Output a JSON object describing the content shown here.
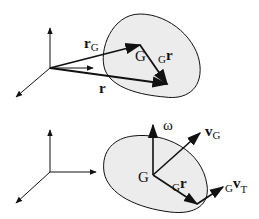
{
  "diagram": {
    "type": "rigid-body kinematics",
    "top_panel": {
      "description": "position vectors of a rigid body",
      "labels": {
        "rG_main": "r",
        "rG_sub": "G",
        "G": "G",
        "Gr_pre": "G",
        "Gr_main": "r",
        "r": "r"
      }
    },
    "bottom_panel": {
      "description": "angular and linear velocity of a rigid body",
      "labels": {
        "omega": "ω",
        "vG_main": "v",
        "vG_sub": "G",
        "G": "G",
        "Gr_pre": "G",
        "Gr_main": "r",
        "GvT_pre": "G",
        "GvT_main": "v",
        "GvT_sub": "T"
      }
    },
    "colors": {
      "body_fill": "#ececec",
      "stroke": "#111111",
      "background": "#ffffff"
    }
  }
}
